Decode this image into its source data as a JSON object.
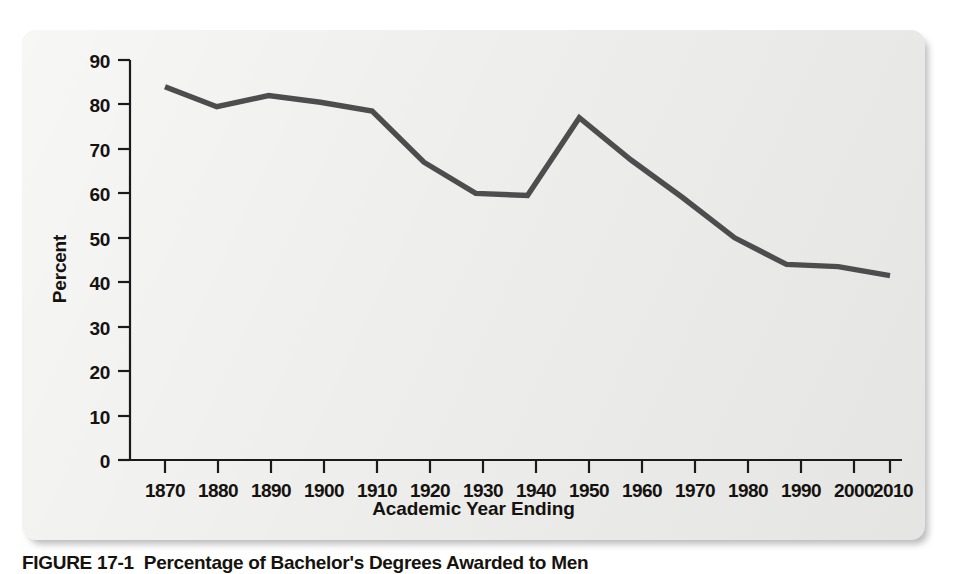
{
  "figure": {
    "caption_number": "FIGURE 17-1",
    "caption_text": "Percentage of Bachelor's Degrees Awarded to Men"
  },
  "colors": {
    "card_background": "#ededeb",
    "line": "#4d4d4d",
    "axis": "#1a1a1a",
    "text": "#15120f",
    "page_background": "#ffffff"
  },
  "chart_data": {
    "type": "line",
    "title": "",
    "xlabel": "Academic Year Ending",
    "ylabel": "Percent",
    "x": [
      1870,
      1880,
      1890,
      1900,
      1910,
      1920,
      1930,
      1940,
      1950,
      1960,
      1970,
      1980,
      1990,
      2000,
      2010
    ],
    "xtick_labels": [
      "1870",
      "1880",
      "1890",
      "1900",
      "1910",
      "1920",
      "1930",
      "1940",
      "1950",
      "1960",
      "1970",
      "1980",
      "1990",
      "2000",
      "2010"
    ],
    "values": [
      84,
      79.5,
      82,
      80.5,
      78.5,
      67,
      60,
      59.5,
      77,
      67.5,
      59,
      50,
      44,
      43.5,
      41.5
    ],
    "ytick_labels": [
      "90",
      "80",
      "70",
      "60",
      "50",
      "40",
      "30",
      "20",
      "10",
      "0"
    ],
    "yticks": [
      90,
      80,
      70,
      60,
      50,
      40,
      30,
      20,
      10,
      0
    ],
    "ylim": [
      0,
      90
    ],
    "xlim": [
      1870,
      2010
    ],
    "grid": false,
    "legend": false,
    "series_name": "Percent of bachelor's degrees awarded to men"
  }
}
